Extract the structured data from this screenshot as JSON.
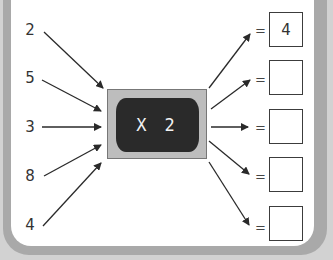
{
  "machine": {
    "operation": "X 2",
    "icon": "function-machine-monitor"
  },
  "inputs": [
    "2",
    "5",
    "3",
    "8",
    "4"
  ],
  "equals": [
    "=",
    "=",
    "=",
    "=",
    "="
  ],
  "outputs": [
    "4",
    "",
    "",
    "",
    ""
  ],
  "colors": {
    "frame": "#a9a9a9",
    "screen": "#2a2a2a",
    "monitor_bezel": "#bdbdbd",
    "text": "#333333"
  }
}
